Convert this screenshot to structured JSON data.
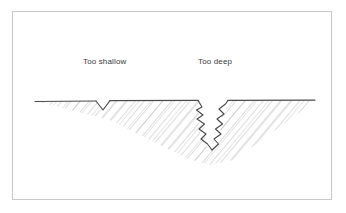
{
  "figure": {
    "background_color": "#ffffff",
    "frame": {
      "border_color": "#c9c9c9",
      "x": 12,
      "y": 11,
      "width": 320,
      "height": 189
    },
    "labels": [
      {
        "id": "too-shallow",
        "text": "Too shallow",
        "x": 83,
        "y": 57,
        "color": "#3a3a3a"
      },
      {
        "id": "too-deep",
        "text": "Too deep",
        "x": 198,
        "y": 57,
        "color": "#3a3a3a"
      }
    ],
    "drawing": {
      "ground_line": {
        "color": "#4a4a4a",
        "y": 101,
        "x_start": 35,
        "x_end": 315
      },
      "hatching": {
        "color": "#b4b4b4",
        "direction": "down-right",
        "angle_deg": 40,
        "spacing_px": 7
      },
      "excavation_outline_color": "#4a4a4a",
      "shallow_notch": {
        "label": "Too shallow",
        "x_left": 96,
        "x_right": 110,
        "apex_x": 103,
        "apex_y": 110,
        "edge_style": "clean"
      },
      "deep_notch": {
        "label": "Too deep",
        "x_left": 198,
        "x_right": 228,
        "apex_x": 212,
        "apex_y": 150,
        "edge_style": "jagged"
      },
      "wedge_bottom_y": 165,
      "wedge_bottom_x": 210
    }
  }
}
